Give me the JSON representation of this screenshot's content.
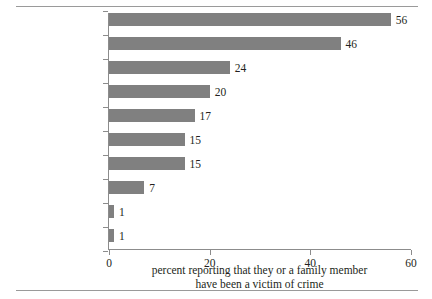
{
  "chart_data": {
    "type": "bar",
    "orientation": "horizontal",
    "title": "",
    "xlabel": "percent reporting that they or a family member have been a victim of crime",
    "ylabel": "",
    "categories": [
      "Robbery",
      "Mugging",
      "Assault",
      "Murder",
      "Attempted assault",
      "Breaking & entering",
      "Police extortion",
      "Extortion",
      "Rape",
      "Sexual abuse"
    ],
    "values": [
      56,
      46,
      24,
      20,
      17,
      15,
      15,
      7,
      1,
      1
    ],
    "value_labels": [
      "56",
      "46",
      "24",
      "20",
      "17",
      "15",
      "15",
      "7",
      "1",
      "1"
    ],
    "xlim": [
      0,
      60
    ],
    "xticks": [
      0,
      20,
      40,
      60
    ],
    "xtick_labels": [
      "0",
      "20",
      "40",
      "60"
    ],
    "grid": false,
    "legend": null,
    "bar_color": "#808080",
    "axis_color": "#8c8c8c"
  },
  "caption": {
    "line1": "percent reporting that they or a family member",
    "line2": "have been a victim of crime"
  }
}
